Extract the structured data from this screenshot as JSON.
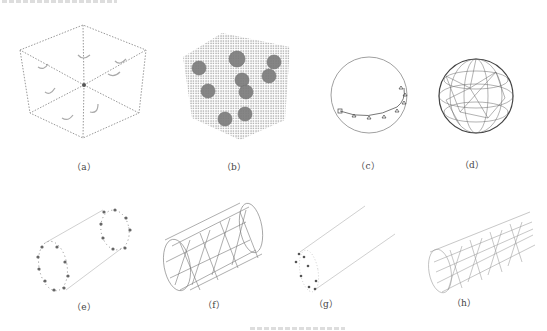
{
  "figure": {
    "panels": [
      {
        "id": "a",
        "label": "（a）",
        "description": "dotted cube wireframe with curved arrows on faces"
      },
      {
        "id": "b",
        "label": "（b）",
        "description": "dense particle cube with 10 dark spherical inclusions"
      },
      {
        "id": "c",
        "label": "（c）",
        "description": "circle with marker points along lower arc"
      },
      {
        "id": "d",
        "label": "（d）",
        "description": "triangulated sphere mesh"
      },
      {
        "id": "e",
        "label": "（e）",
        "description": "cylinder outline with dotted end rings"
      },
      {
        "id": "f",
        "label": "（f）",
        "description": "triangulated cylinder mesh"
      },
      {
        "id": "g",
        "label": "（g）",
        "description": "cylinder outline with partial dotted end ring"
      },
      {
        "id": "h",
        "label": "（h）",
        "description": "sparse triangulated cylinder mesh"
      }
    ],
    "colors": {
      "line": "#888888",
      "dark": "#555555",
      "inclusion": "#7a7a7a"
    }
  }
}
